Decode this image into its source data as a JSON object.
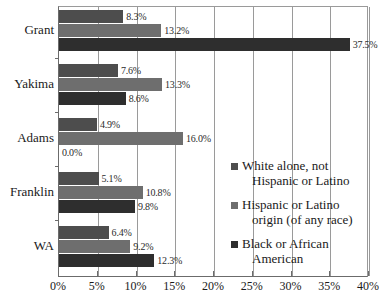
{
  "chart_data": {
    "type": "bar",
    "orientation": "horizontal",
    "title": "",
    "xlabel": "",
    "ylabel": "",
    "xlim": [
      0,
      40
    ],
    "xtick_labels": [
      "0%",
      "5%",
      "10%",
      "15%",
      "20%",
      "25%",
      "30%",
      "35%",
      "40%"
    ],
    "xtick_values": [
      0,
      5,
      10,
      15,
      20,
      25,
      30,
      35,
      40
    ],
    "grid": true,
    "legend_position": "center-right",
    "categories": [
      "Grant",
      "Yakima",
      "Adams",
      "Franklin",
      "WA"
    ],
    "series": [
      {
        "name": "White alone, not Hispanic or Latino",
        "color": "#4d4d4d",
        "values": [
          8.3,
          7.6,
          4.9,
          5.1,
          6.4
        ],
        "labels": [
          "8.3%",
          "7.6%",
          "4.9%",
          "5.1%",
          "6.4%"
        ]
      },
      {
        "name": "Hispanic or Latino origin (of any race)",
        "color": "#6e6e6e",
        "values": [
          13.2,
          13.3,
          16.0,
          10.8,
          9.2
        ],
        "labels": [
          "13.2%",
          "13.3%",
          "16.0%",
          "10.8%",
          "9.2%"
        ]
      },
      {
        "name": "Black or African American",
        "color": "#2e2e2e",
        "values": [
          37.5,
          8.6,
          0.0,
          9.8,
          12.3
        ],
        "labels": [
          "37.5%",
          "8.6%",
          "0.0%",
          "9.8%",
          "12.3%"
        ]
      }
    ]
  },
  "legend": {
    "items": [
      {
        "label_line1": "White alone, not",
        "label_line2": "Hispanic or Latino",
        "color": "#4d4d4d"
      },
      {
        "label_line1": "Hispanic or Latino",
        "label_line2": "origin (of any race)",
        "color": "#6e6e6e"
      },
      {
        "label_line1": "Black or African",
        "label_line2": "American",
        "color": "#2e2e2e"
      }
    ]
  }
}
